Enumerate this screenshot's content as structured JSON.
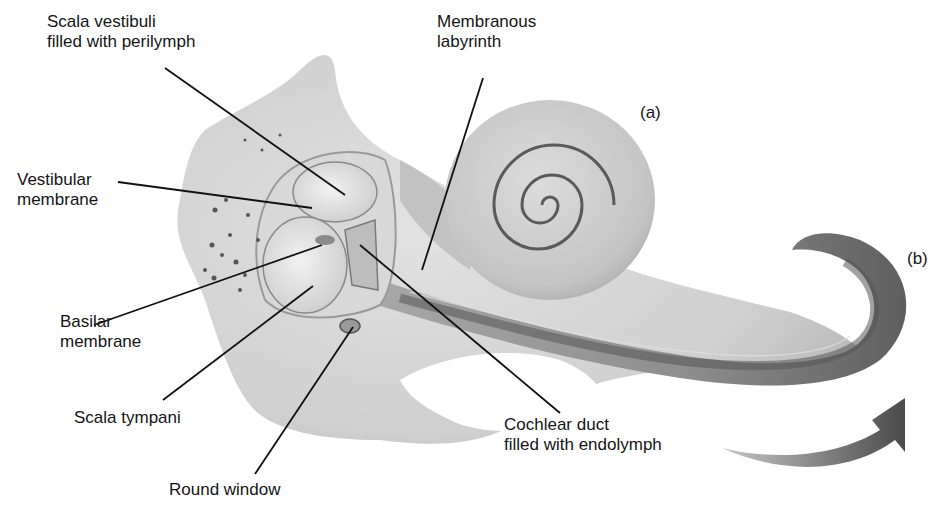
{
  "figure": {
    "panel_labels": {
      "a": "(a)",
      "b": "(b)"
    },
    "labels": {
      "scala_vestibuli": {
        "line1": "Scala vestibuli",
        "line2": "filled with perilymph"
      },
      "membranous_labyrinth": {
        "line1": "Membranous",
        "line2": "labyrinth"
      },
      "vestibular_membrane": {
        "line1": "Vestibular",
        "line2": "membrane"
      },
      "basilar_membrane": {
        "line1": "Basilar",
        "line2": "membrane"
      },
      "scala_tympani": {
        "line1": "Scala tympani"
      },
      "round_window": {
        "line1": "Round window"
      },
      "cochlear_duct": {
        "line1": "Cochlear duct",
        "line2": "filled with endolymph"
      }
    },
    "colors": {
      "background": "#ffffff",
      "bone_light": "#d6d6d6",
      "bone_mid": "#b8b8b8",
      "tube_dark": "#6e6e6e",
      "leader_line": "#111111"
    }
  }
}
